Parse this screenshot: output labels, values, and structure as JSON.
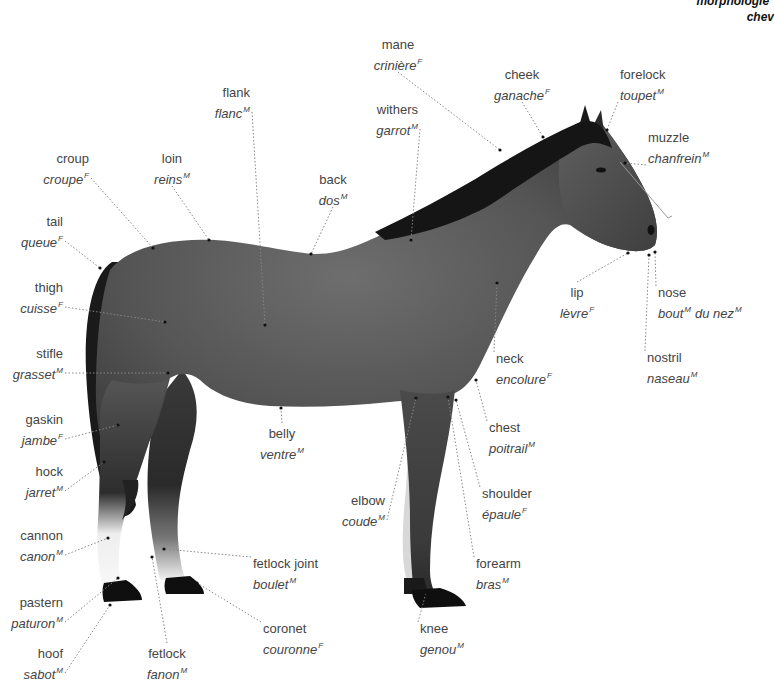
{
  "title": {
    "line1": "morphologie",
    "line1_sup": "F",
    "line2": "chev"
  },
  "colors": {
    "background": "#ffffff",
    "text": "#444444",
    "horse_body": "#555555",
    "horse_dark": "#1e1e1e",
    "leader_line": "#888888"
  },
  "labels": [
    {
      "id": "mane",
      "en": "mane",
      "fr": "crinière",
      "gender": "F",
      "x": 398,
      "y": 36,
      "align": "center",
      "pt": [
        500,
        150
      ]
    },
    {
      "id": "cheek",
      "en": "cheek",
      "fr": "ganache",
      "gender": "F",
      "x": 522,
      "y": 66,
      "align": "center",
      "pt": [
        543,
        137
      ]
    },
    {
      "id": "forelock",
      "en": "forelock",
      "fr": "toupet",
      "gender": "M",
      "x": 620,
      "y": 66,
      "align": "left",
      "pt": [
        607,
        130
      ]
    },
    {
      "id": "flank",
      "en": "flank",
      "fr": "flanc",
      "gender": "M",
      "x": 250,
      "y": 84,
      "align": "right",
      "pt": [
        265,
        325
      ]
    },
    {
      "id": "withers",
      "en": "withers",
      "fr": "garrot",
      "gender": "M",
      "x": 418,
      "y": 101,
      "align": "right",
      "pt": [
        411,
        240
      ]
    },
    {
      "id": "muzzle",
      "en": "muzzle",
      "fr": "chanfrein",
      "gender": "M",
      "x": 648,
      "y": 129,
      "align": "left",
      "pt": [
        625,
        163
      ]
    },
    {
      "id": "croup",
      "en": "croup",
      "fr": "croupe",
      "gender": "F",
      "x": 89,
      "y": 150,
      "align": "right",
      "pt": [
        153,
        248
      ]
    },
    {
      "id": "loin",
      "en": "loin",
      "fr": "reins",
      "gender": "M",
      "x": 172,
      "y": 150,
      "align": "center",
      "pt": [
        209,
        240
      ]
    },
    {
      "id": "back",
      "en": "back",
      "fr": "dos",
      "gender": "M",
      "x": 333,
      "y": 171,
      "align": "center",
      "pt": [
        311,
        254
      ]
    },
    {
      "id": "tail",
      "en": "tail",
      "fr": "queue",
      "gender": "F",
      "x": 63,
      "y": 213,
      "align": "right",
      "pt": [
        100,
        268
      ]
    },
    {
      "id": "thigh",
      "en": "thigh",
      "fr": "cuisse",
      "gender": "F",
      "x": 63,
      "y": 279,
      "align": "right",
      "pt": [
        165,
        322
      ]
    },
    {
      "id": "lip",
      "en": "lip",
      "fr": "lèvre",
      "gender": "F",
      "x": 577,
      "y": 284,
      "align": "center",
      "pt": [
        628,
        253
      ]
    },
    {
      "id": "nose",
      "en": "nose",
      "fr": "bout",
      "gender": "M",
      "fr2": "du nez",
      "gender2": "M",
      "x": 658,
      "y": 284,
      "align": "left",
      "pt": [
        655,
        252
      ]
    },
    {
      "id": "stifle",
      "en": "stifle",
      "fr": "grasset",
      "gender": "M",
      "x": 63,
      "y": 345,
      "align": "right",
      "pt": [
        168,
        373
      ]
    },
    {
      "id": "neck",
      "en": "neck",
      "fr": "encolure",
      "gender": "F",
      "x": 496,
      "y": 350,
      "align": "left",
      "pt": [
        497,
        283
      ]
    },
    {
      "id": "nostril",
      "en": "nostril",
      "fr": "naseau",
      "gender": "M",
      "x": 647,
      "y": 349,
      "align": "left",
      "pt": [
        649,
        255
      ]
    },
    {
      "id": "belly",
      "en": "belly",
      "fr": "ventre",
      "gender": "M",
      "x": 282,
      "y": 425,
      "align": "center",
      "pt": [
        281,
        408
      ]
    },
    {
      "id": "chest",
      "en": "chest",
      "fr": "poitrail",
      "gender": "M",
      "x": 489,
      "y": 419,
      "align": "left",
      "pt": [
        476,
        380
      ]
    },
    {
      "id": "gaskin",
      "en": "gaskin",
      "fr": "jambe",
      "gender": "F",
      "x": 63,
      "y": 411,
      "align": "right",
      "pt": [
        118,
        425
      ]
    },
    {
      "id": "hock",
      "en": "hock",
      "fr": "jarret",
      "gender": "M",
      "x": 63,
      "y": 463,
      "align": "right",
      "pt": [
        104,
        462
      ]
    },
    {
      "id": "shoulder",
      "en": "shoulder",
      "fr": "épaule",
      "gender": "F",
      "x": 482,
      "y": 485,
      "align": "left",
      "pt": [
        456,
        400
      ]
    },
    {
      "id": "elbow",
      "en": "elbow",
      "fr": "coude",
      "gender": "M",
      "x": 385,
      "y": 492,
      "align": "right",
      "pt": [
        416,
        398
      ]
    },
    {
      "id": "cannon",
      "en": "cannon",
      "fr": "canon",
      "gender": "M",
      "x": 63,
      "y": 527,
      "align": "right",
      "pt": [
        108,
        538
      ]
    },
    {
      "id": "fetlock_joint",
      "en": "fetlock joint",
      "fr": "boulet",
      "gender": "M",
      "x": 253,
      "y": 555,
      "align": "left",
      "pt": [
        164,
        549
      ]
    },
    {
      "id": "forearm",
      "en": "forearm",
      "fr": "bras",
      "gender": "M",
      "x": 476,
      "y": 555,
      "align": "left",
      "pt": [
        448,
        397
      ]
    },
    {
      "id": "pastern",
      "en": "pastern",
      "fr": "paturon",
      "gender": "M",
      "x": 63,
      "y": 594,
      "align": "right",
      "pt": [
        118,
        578
      ]
    },
    {
      "id": "coronet",
      "en": "coronet",
      "fr": "couronne",
      "gender": "F",
      "x": 263,
      "y": 620,
      "align": "left",
      "pt": [
        197,
        583
      ]
    },
    {
      "id": "knee",
      "en": "knee",
      "fr": "genou",
      "gender": "M",
      "x": 420,
      "y": 620,
      "align": "left",
      "pt": [
        426,
        593
      ]
    },
    {
      "id": "hoof",
      "en": "hoof",
      "fr": "sabot",
      "gender": "M",
      "x": 63,
      "y": 645,
      "align": "right",
      "pt": [
        110,
        605
      ]
    },
    {
      "id": "fetlock",
      "en": "fetlock",
      "fr": "fanon",
      "gender": "M",
      "x": 167,
      "y": 645,
      "align": "center",
      "pt": [
        152,
        557
      ]
    }
  ]
}
